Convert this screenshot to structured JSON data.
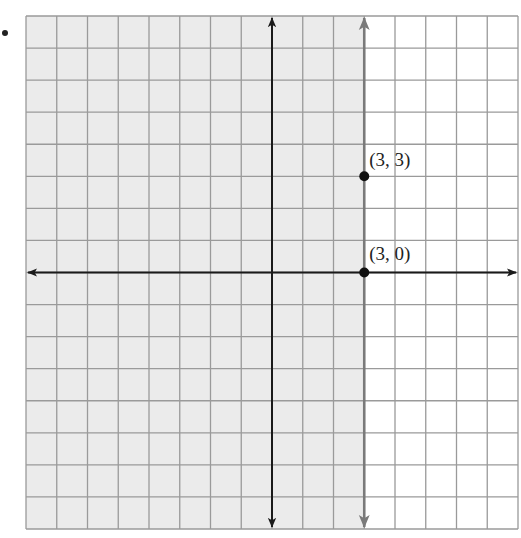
{
  "chart_data": {
    "type": "scatter",
    "title": "",
    "xlabel": "",
    "ylabel": "",
    "grid": true,
    "xlim": [
      -8,
      8
    ],
    "ylim": [
      -8,
      8
    ],
    "boundary_line": {
      "type": "vertical",
      "x": 3,
      "style": "solid",
      "color": "#808080"
    },
    "shaded_region": {
      "side": "left",
      "inequality": "x <= 3",
      "color": "#ebebeb"
    },
    "points": [
      {
        "x": 3,
        "y": 3,
        "label": "(3, 3)"
      },
      {
        "x": 3,
        "y": 0,
        "label": "(3, 0)"
      }
    ]
  },
  "labels": {
    "p1": "(3, 3)",
    "p2": "(3, 0)"
  },
  "colors": {
    "shade": "#ebebeb",
    "grid": "#9a9a9a",
    "axis": "#1a1a1a",
    "boundary": "#7a7a7a"
  }
}
